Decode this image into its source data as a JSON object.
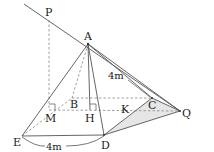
{
  "diagram": {
    "type": "geometry-3d",
    "points": {
      "P": {
        "label": "P",
        "x": 49,
        "y": 20,
        "lx": 45,
        "ly": 16
      },
      "A": {
        "label": "A",
        "x": 88,
        "y": 44,
        "lx": 84,
        "ly": 39
      },
      "B": {
        "label": "B",
        "x": 72,
        "y": 98,
        "lx": 70,
        "ly": 108
      },
      "C": {
        "label": "C",
        "x": 152,
        "y": 98,
        "lx": 148,
        "ly": 108
      },
      "D": {
        "label": "D",
        "x": 104,
        "y": 135,
        "lx": 102,
        "ly": 148
      },
      "E": {
        "label": "E",
        "x": 22,
        "y": 136,
        "lx": 13,
        "ly": 145
      },
      "M": {
        "label": "M",
        "x": 50,
        "y": 110,
        "lx": 46,
        "ly": 122
      },
      "H": {
        "label": "H",
        "x": 90,
        "y": 110,
        "lx": 86,
        "ly": 122
      },
      "K": {
        "label": "K",
        "x": 137,
        "y": 109,
        "lx": 121,
        "ly": 112
      },
      "Q": {
        "label": "Q",
        "x": 180,
        "y": 111,
        "lx": 183,
        "ly": 117
      }
    },
    "measurements": [
      {
        "label": "4m",
        "x": 140,
        "y": 75,
        "for": "AC"
      },
      {
        "label": "4m",
        "x": 51,
        "y": 148,
        "for": "ED"
      }
    ],
    "colors": {
      "stroke": "#555555",
      "dashed": "#888888",
      "shade": "#e6e6e6"
    }
  }
}
